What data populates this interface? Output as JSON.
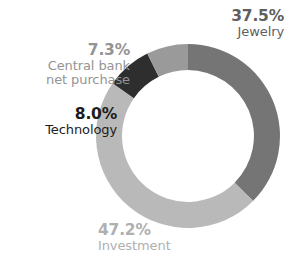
{
  "chart_data": {
    "type": "pie",
    "variant": "donut",
    "title": "",
    "subtitle": "",
    "xlabel": "",
    "ylabel": "",
    "legend_position": "callout-labels",
    "grid": false,
    "units": "percent",
    "total": 100.0,
    "start_angle_deg": 0,
    "direction": "clockwise",
    "inner_radius_ratio": 0.717,
    "categories": [
      "Jewelry",
      "Investment",
      "Technology",
      "Central bank net purchase"
    ],
    "values": [
      37.5,
      47.2,
      8.0,
      7.3
    ],
    "slices": [
      {
        "label": "Jewelry",
        "label_lines": [
          "Jewelry"
        ],
        "value": 37.5,
        "value_text": "37.5%",
        "color": "#757575",
        "text_color": "#5f5f5f",
        "align": "right"
      },
      {
        "label": "Investment",
        "label_lines": [
          "Investment"
        ],
        "value": 47.2,
        "value_text": "47.2%",
        "color": "#b9b9b9",
        "text_color": "#b0b0b0",
        "align": "left"
      },
      {
        "label": "Technology",
        "label_lines": [
          "Technology"
        ],
        "value": 8.0,
        "value_text": "8.0%",
        "color": "#2e2e2e",
        "text_color": "#1c1c1c",
        "align": "right"
      },
      {
        "label": "Central bank net purchase",
        "label_lines": [
          "Central bank",
          "net purchase"
        ],
        "value": 7.3,
        "value_text": "7.3%",
        "color": "#9a9a9a",
        "text_color": "#949494",
        "align": "right"
      }
    ]
  },
  "labels": {
    "jewelry": {
      "pct": "37.5%",
      "cat_line_1": "Jewelry"
    },
    "central_bank": {
      "pct": "7.3%",
      "cat_line_1": "Central bank",
      "cat_line_2": "net purchase"
    },
    "technology": {
      "pct": "8.0%",
      "cat_line_1": "Technology"
    },
    "investment": {
      "pct": "47.2%",
      "cat_line_1": "Investment"
    }
  },
  "colors": {
    "jewelry": "#757575",
    "investment": "#b9b9b9",
    "technology": "#2e2e2e",
    "central_bank": "#9a9a9a",
    "jewelry_text": "#5f5f5f",
    "investment_text": "#b0b0b0",
    "technology_text": "#1c1c1c",
    "central_bank_text": "#949494",
    "background": "#ffffff"
  }
}
